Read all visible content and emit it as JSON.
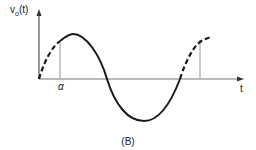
{
  "diagram": {
    "y_axis_label": "v",
    "y_axis_subscript": "o",
    "y_axis_arg": "(t)",
    "x_axis_label": "t",
    "alpha_label": "α",
    "caption": "(B)",
    "colors": {
      "curve": "#1a1a1a",
      "axis": "#333333",
      "marker": "#999999"
    }
  }
}
